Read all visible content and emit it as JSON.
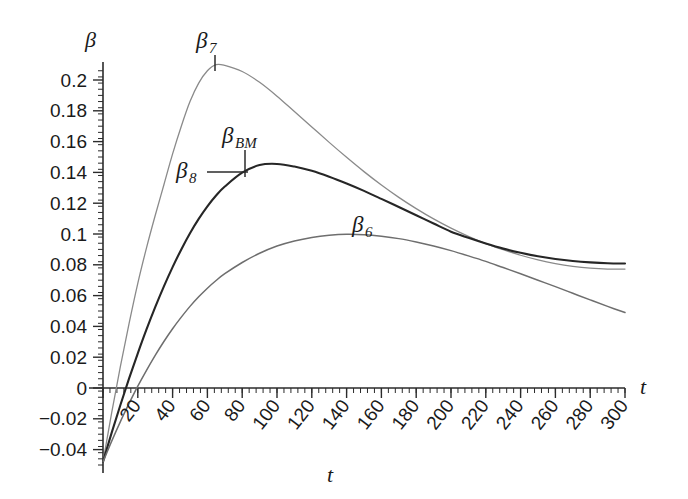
{
  "chart_data": {
    "type": "line",
    "title": "",
    "xlabel": "t",
    "ylabel": "β",
    "xlim": [
      0,
      300
    ],
    "ylim": [
      -0.05,
      0.215
    ],
    "grid": false,
    "legend": "inline-annotations",
    "x_ticks": [
      0,
      20,
      40,
      60,
      80,
      100,
      120,
      140,
      160,
      180,
      200,
      220,
      240,
      260,
      280,
      300
    ],
    "x_tick_labels": [
      "",
      "20",
      "40",
      "60",
      "80",
      "100",
      "120",
      "140",
      "160",
      "180",
      "200",
      "220",
      "240",
      "260",
      "280",
      "300"
    ],
    "y_ticks": [
      -0.04,
      -0.02,
      0,
      0.02,
      0.04,
      0.06,
      0.08,
      0.1,
      0.12,
      0.14,
      0.16,
      0.18,
      0.2
    ],
    "y_tick_labels": [
      "−0.04",
      "−0.02",
      "0",
      "0.02",
      "0.04",
      "0.06",
      "0.08",
      "0.1",
      "0.12",
      "0.14",
      "0.16",
      "0.18",
      "0.2"
    ],
    "x_minor_interval": 4,
    "y_minor_interval": 0.004,
    "series": [
      {
        "name": "β7",
        "label_base": "β",
        "label_sub": "7",
        "color": "#8a8a8a",
        "width": 1.3,
        "peak_t": 65,
        "peak_value": 0.21,
        "end_value": 0.086,
        "start_value": -0.048,
        "x": [
          0,
          5,
          10,
          15,
          20,
          25,
          30,
          35,
          40,
          45,
          50,
          55,
          60,
          65,
          70,
          80,
          90,
          100,
          110,
          120,
          130,
          140,
          150,
          160,
          170,
          180,
          190,
          200,
          210,
          220,
          230,
          240,
          250,
          260,
          270,
          280,
          290,
          300
        ],
        "y": [
          -0.048,
          -0.016,
          0.014,
          0.042,
          0.068,
          0.091,
          0.112,
          0.132,
          0.152,
          0.17,
          0.186,
          0.198,
          0.206,
          0.21,
          0.2095,
          0.2055,
          0.1985,
          0.1895,
          0.1795,
          0.1695,
          0.1595,
          0.1498,
          0.1405,
          0.1318,
          0.1238,
          0.1165,
          0.1098,
          0.1038,
          0.0985,
          0.0938,
          0.0898,
          0.0862,
          0.0832,
          0.0808,
          0.079,
          0.0778,
          0.0772,
          0.0772
        ]
      },
      {
        "name": "β8 / βBM",
        "label_base": "β",
        "label_sub": "8",
        "color": "#262626",
        "width": 2.1,
        "peak_t": 100,
        "peak_value": 0.1455,
        "end_value": 0.082,
        "start_value": -0.048,
        "x": [
          0,
          5,
          10,
          15,
          20,
          25,
          30,
          35,
          40,
          45,
          50,
          55,
          60,
          65,
          70,
          80,
          90,
          100,
          110,
          120,
          130,
          140,
          150,
          160,
          170,
          180,
          190,
          200,
          210,
          220,
          230,
          240,
          250,
          260,
          270,
          280,
          290,
          300
        ],
        "y": [
          -0.048,
          -0.029,
          -0.011,
          0.0062,
          0.0225,
          0.038,
          0.0525,
          0.066,
          0.0785,
          0.09,
          0.1005,
          0.1098,
          0.118,
          0.125,
          0.1308,
          0.1398,
          0.1448,
          0.1455,
          0.1438,
          0.141,
          0.1372,
          0.1328,
          0.128,
          0.1228,
          0.1175,
          0.1122,
          0.1068,
          0.1015,
          0.0975,
          0.0938,
          0.0905,
          0.0878,
          0.0855,
          0.0838,
          0.0825,
          0.0816,
          0.081,
          0.0808
        ]
      },
      {
        "name": "β6",
        "label_base": "β",
        "label_sub": "6",
        "color": "#6e6e6e",
        "width": 1.5,
        "peak_t": 95,
        "peak_value": 0.1,
        "end_value": 0.043,
        "start_value": -0.048,
        "x": [
          0,
          5,
          10,
          15,
          20,
          25,
          30,
          35,
          40,
          45,
          50,
          55,
          60,
          65,
          70,
          80,
          90,
          100,
          110,
          120,
          130,
          140,
          150,
          160,
          170,
          180,
          190,
          200,
          210,
          220,
          230,
          240,
          250,
          260,
          270,
          280,
          290,
          300
        ],
        "y": [
          -0.048,
          -0.0345,
          -0.0218,
          -0.01,
          0.0012,
          0.0115,
          0.0212,
          0.0302,
          0.0385,
          0.046,
          0.053,
          0.0592,
          0.0648,
          0.0698,
          0.0742,
          0.0815,
          0.0875,
          0.0922,
          0.0955,
          0.0978,
          0.0992,
          0.0998,
          0.0995,
          0.0985,
          0.097,
          0.0948,
          0.0922,
          0.0892,
          0.0858,
          0.0822,
          0.0782,
          0.0742,
          0.07,
          0.0658,
          0.0615,
          0.0572,
          0.053,
          0.049
        ]
      }
    ],
    "annotations": [
      {
        "name": "beta7",
        "text_base": "β",
        "text_sub": "7",
        "leader": "vertical"
      },
      {
        "name": "betaBM",
        "text_base": "β",
        "text_sub": "BM",
        "leader": "vertical"
      },
      {
        "name": "beta8",
        "text_base": "β",
        "text_sub": "8",
        "leader": "horizontal"
      },
      {
        "name": "beta6",
        "text_base": "β",
        "text_sub": "6",
        "leader": "none"
      }
    ]
  },
  "axis": {
    "y_axis_name": "β",
    "x_axis_name_right": "t",
    "x_axis_name_bottom": "t"
  }
}
